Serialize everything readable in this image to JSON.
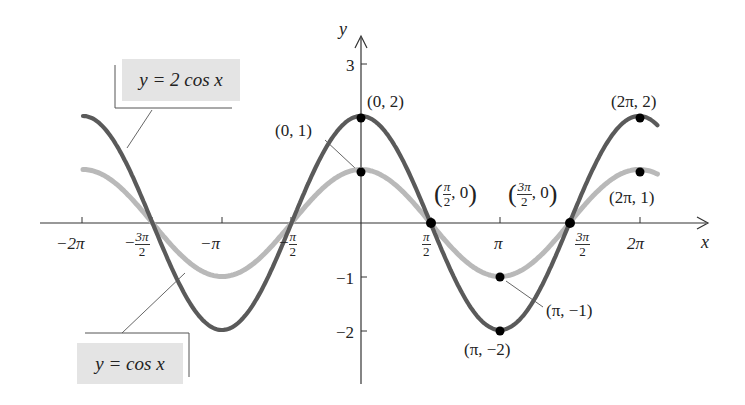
{
  "chart_data": {
    "type": "line",
    "title": "",
    "xlabel": "x",
    "ylabel": "y",
    "xlim": [
      -6.2832,
      6.7
    ],
    "ylim": [
      -2.6,
      3.3
    ],
    "grid": false,
    "x_ticks": [
      "-2π",
      "-3π/2",
      "-π",
      "-π/2",
      "π/2",
      "π",
      "3π/2",
      "2π"
    ],
    "y_ticks": [
      "3",
      "-1",
      "-2"
    ],
    "series": [
      {
        "name": "y = 2 cos x",
        "function": "2*cos(x)",
        "color": "#5a5a5a",
        "amplitude": 2
      },
      {
        "name": "y = cos x",
        "function": "cos(x)",
        "color": "#b9b9b9",
        "amplitude": 1
      }
    ],
    "points": [
      {
        "label": "(0, 2)",
        "x": 0,
        "y": 2
      },
      {
        "label": "(0, 1)",
        "x": 0,
        "y": 1
      },
      {
        "label": "(π/2, 0)",
        "x": 1.5708,
        "y": 0
      },
      {
        "label": "(3π/2, 0)",
        "x": 4.7124,
        "y": 0
      },
      {
        "label": "(π, -1)",
        "x": 3.1416,
        "y": -1
      },
      {
        "label": "(π, -2)",
        "x": 3.1416,
        "y": -2
      },
      {
        "label": "(2π, 2)",
        "x": 6.2832,
        "y": 2
      },
      {
        "label": "(2π, 1)",
        "x": 6.2832,
        "y": 1
      }
    ],
    "legend_callouts": [
      "y = 2 cos x",
      "y = cos x"
    ]
  },
  "axes": {
    "x_label": "x",
    "y_label": "y"
  },
  "ticks": {
    "x": {
      "neg2pi": "−2π",
      "neg3pi2_num": "3π",
      "neg3pi2_den": "2",
      "neg_sign": "−",
      "negpi": "−π",
      "negpi2_num": "π",
      "negpi2_den": "2",
      "pi2_num": "π",
      "pi2_den": "2",
      "pi": "π",
      "threepi2_num": "3π",
      "threepi2_den": "2",
      "twopi": "2π"
    },
    "y": {
      "three": "3",
      "neg1": "−1",
      "neg2": "−2"
    }
  },
  "labels": {
    "p02": "(0, 2)",
    "p01": "(0, 1)",
    "p2pi2": "(2π, 2)",
    "p2pi1": "(2π, 1)",
    "ppi_m1": "(π, −1)",
    "ppi_m2": "(π, −2)",
    "pi2_zero_num": "π",
    "pi2_zero_den": "2",
    "zero_tail": ", 0",
    "threepi2_zero_num": "3π",
    "threepi2_zero_den": "2",
    "open_paren": "(",
    "close_paren": ")"
  },
  "legend": {
    "two_cos": "y = 2 cos x",
    "cos": "y = cos x"
  },
  "colors": {
    "dark_curve": "#5a5a5a",
    "light_curve": "#bababa",
    "legend_bg": "#e4e4e4",
    "axis": "#333333"
  }
}
